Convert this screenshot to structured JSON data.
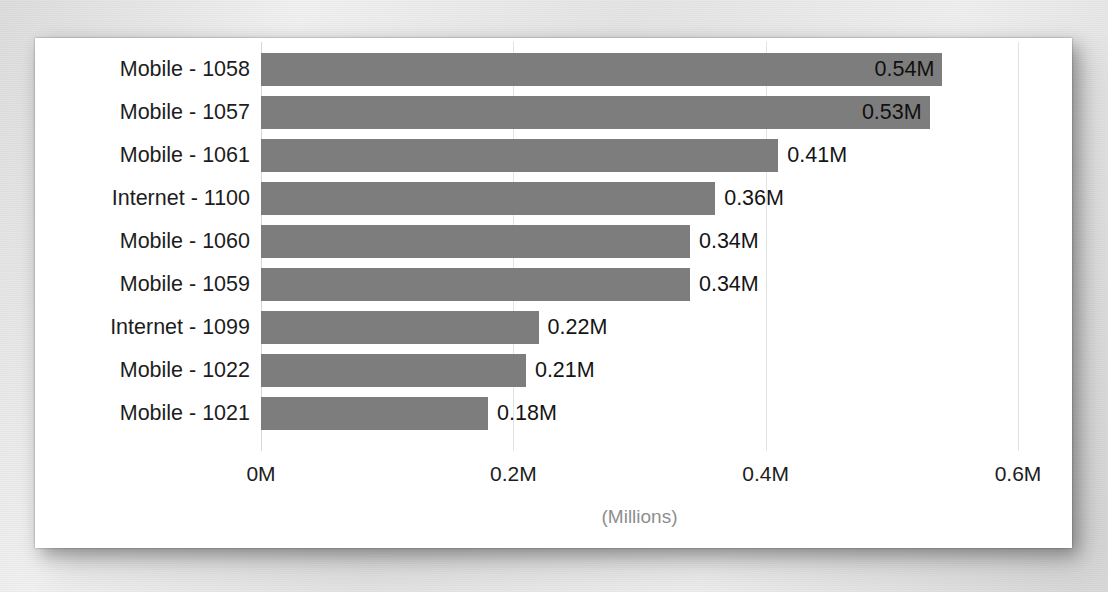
{
  "chart_data": {
    "type": "bar",
    "orientation": "horizontal",
    "title": "",
    "subtitle": "",
    "xlabel": "(Millions)",
    "ylabel": "",
    "categories": [
      "Mobile - 1058",
      "Mobile - 1057",
      "Mobile - 1061",
      "Internet - 1100",
      "Mobile - 1060",
      "Mobile - 1059",
      "Internet - 1099",
      "Mobile - 1022",
      "Mobile - 1021"
    ],
    "values": [
      0.54,
      0.53,
      0.41,
      0.36,
      0.34,
      0.34,
      0.22,
      0.21,
      0.18
    ],
    "data_labels": [
      "0.54M",
      "0.53M",
      "0.41M",
      "0.36M",
      "0.34M",
      "0.34M",
      "0.22M",
      "0.21M",
      "0.18M"
    ],
    "label_placement": [
      "inside",
      "inside",
      "outside",
      "outside",
      "outside",
      "outside",
      "outside",
      "outside",
      "outside"
    ],
    "xlim": [
      0,
      0.6
    ],
    "xticks": [
      0,
      0.2,
      0.4,
      0.6
    ],
    "xtick_labels": [
      "0M",
      "0.2M",
      "0.4M",
      "0.6M"
    ],
    "grid": true,
    "grid_axis": "x",
    "legend": false,
    "legend_position": "none",
    "unit_suffix": "M",
    "bar_color": "#7d7d7d",
    "plot_background": "#ffffff",
    "gridline_color": "#e2e2e2",
    "label_text_color": "#1d1d1d",
    "axis_title_color": "#8e8e8e"
  }
}
